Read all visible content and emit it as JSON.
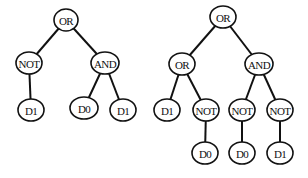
{
  "diagram": {
    "type": "expression-trees",
    "trees": [
      {
        "name": "left-tree",
        "nodes": [
          {
            "id": "L0",
            "label": "OR",
            "x": 66,
            "y": 20,
            "rx": 12,
            "ry": 11
          },
          {
            "id": "L1",
            "label": "NOT",
            "x": 29,
            "y": 63,
            "rx": 13,
            "ry": 11
          },
          {
            "id": "L2",
            "label": "AND",
            "x": 105,
            "y": 63,
            "rx": 14,
            "ry": 11
          },
          {
            "id": "L3",
            "label": "D1",
            "x": 31,
            "y": 110,
            "rx": 13,
            "ry": 11
          },
          {
            "id": "L4",
            "label": "D0",
            "x": 84,
            "y": 108,
            "rx": 14,
            "ry": 11
          },
          {
            "id": "L5",
            "label": "D1",
            "x": 123,
            "y": 110,
            "rx": 13,
            "ry": 11
          }
        ],
        "edges": [
          [
            "L0",
            "L1"
          ],
          [
            "L0",
            "L2"
          ],
          [
            "L1",
            "L3"
          ],
          [
            "L2",
            "L4"
          ],
          [
            "L2",
            "L5"
          ]
        ]
      },
      {
        "name": "right-tree",
        "nodes": [
          {
            "id": "R0",
            "label": "OR",
            "x": 223,
            "y": 17,
            "rx": 13,
            "ry": 11
          },
          {
            "id": "R1",
            "label": "OR",
            "x": 182,
            "y": 64,
            "rx": 13,
            "ry": 11
          },
          {
            "id": "R2",
            "label": "AND",
            "x": 259,
            "y": 64,
            "rx": 14,
            "ry": 11
          },
          {
            "id": "R3",
            "label": "D1",
            "x": 167,
            "y": 110,
            "rx": 13,
            "ry": 11
          },
          {
            "id": "R4",
            "label": "NOT",
            "x": 206,
            "y": 110,
            "rx": 13,
            "ry": 11
          },
          {
            "id": "R5",
            "label": "NOT",
            "x": 242,
            "y": 110,
            "rx": 13,
            "ry": 11
          },
          {
            "id": "R6",
            "label": "NOT",
            "x": 280,
            "y": 110,
            "rx": 13,
            "ry": 11
          },
          {
            "id": "R7",
            "label": "D0",
            "x": 205,
            "y": 153,
            "rx": 13,
            "ry": 11
          },
          {
            "id": "R8",
            "label": "D0",
            "x": 242,
            "y": 153,
            "rx": 13,
            "ry": 11
          },
          {
            "id": "R9",
            "label": "D1",
            "x": 280,
            "y": 153,
            "rx": 13,
            "ry": 11
          }
        ],
        "edges": [
          [
            "R0",
            "R1"
          ],
          [
            "R0",
            "R2"
          ],
          [
            "R1",
            "R3"
          ],
          [
            "R1",
            "R4"
          ],
          [
            "R2",
            "R5"
          ],
          [
            "R2",
            "R6"
          ],
          [
            "R4",
            "R7"
          ],
          [
            "R5",
            "R8"
          ],
          [
            "R6",
            "R9"
          ]
        ]
      }
    ]
  },
  "colors": {
    "background": "#ffffff",
    "stroke": "#111111",
    "text": "#111111"
  }
}
